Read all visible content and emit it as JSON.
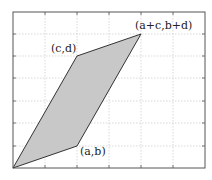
{
  "diagram": {
    "title": "",
    "type": "parallelogram",
    "frame": {
      "x": 13,
      "y": 12,
      "width": 192,
      "height": 156
    },
    "grid": {
      "vertical_x": [
        45,
        77,
        109,
        141,
        173
      ],
      "horizontal_y": [
        34,
        56,
        78,
        101,
        123,
        146
      ]
    },
    "colors": {
      "fill": "#c8c8c8",
      "stroke": "#333333",
      "grid": "#cfcfcf",
      "frame": "#555555"
    },
    "vertices": [
      {
        "id": "origin",
        "label": "",
        "x": 13,
        "y": 168
      },
      {
        "id": "ab",
        "label": "(a,b)",
        "x": 77,
        "y": 146
      },
      {
        "id": "apc",
        "label": "(a+c,b+d)",
        "x": 141,
        "y": 34
      },
      {
        "id": "cd",
        "label": "(c,d)",
        "x": 77,
        "y": 56
      }
    ],
    "labels": {
      "ab": "(a,b)",
      "cd": "(c,d)",
      "apc": "(a+c,b+d)"
    }
  }
}
